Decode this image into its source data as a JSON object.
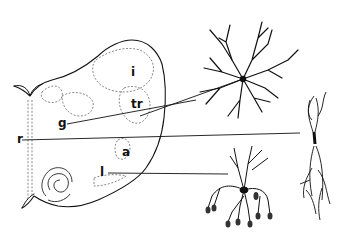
{
  "figure": {
    "type": "neuroanatomy line drawing",
    "background": "#ffffff",
    "ink": "#111111",
    "section_labels": [
      {
        "id": "i",
        "text": "i",
        "x": 131,
        "y": 66
      },
      {
        "id": "tr",
        "text": "tr",
        "x": 131,
        "y": 98
      },
      {
        "id": "g",
        "text": "g",
        "x": 58,
        "y": 117
      },
      {
        "id": "r",
        "text": "r",
        "x": 17,
        "y": 136
      },
      {
        "id": "a",
        "text": "a",
        "x": 122,
        "y": 149
      },
      {
        "id": "l",
        "text": "l",
        "x": 100,
        "y": 168
      }
    ],
    "leader_lines": [
      {
        "from": "g",
        "to": "stellate-neuron"
      },
      {
        "from": "r",
        "to": "bipolar-neuron"
      },
      {
        "from": "l",
        "to": "tufted-neuron"
      },
      {
        "from": "tr",
        "to": "stellate-neuron"
      }
    ],
    "neurons": [
      {
        "id": "stellate-neuron",
        "description": "multipolar stellate cell"
      },
      {
        "id": "bipolar-neuron",
        "description": "elongated bipolar cell"
      },
      {
        "id": "tufted-neuron",
        "description": "tufted cell with dendritic glomeruli"
      }
    ]
  }
}
